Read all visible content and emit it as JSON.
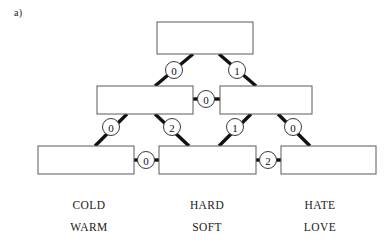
{
  "panel": {
    "label": "a)"
  },
  "diagram": {
    "type": "hierarchical-tree",
    "colors": {
      "background": "#ffffff",
      "box_fill": "#ffffff",
      "box_stroke": "#5a5a5a",
      "edge": "#111111",
      "circle_fill": "#ffffff",
      "circle_stroke": "#3a3a3a",
      "text": "#1a1a1a"
    },
    "nodes": [
      {
        "id": "root",
        "row": 1,
        "x": 157,
        "y": 22,
        "w": 96,
        "h": 32,
        "text": ""
      },
      {
        "id": "mid-left",
        "row": 2,
        "x": 97,
        "y": 86,
        "w": 96,
        "h": 28,
        "text": ""
      },
      {
        "id": "mid-right",
        "row": 2,
        "x": 220,
        "y": 86,
        "w": 92,
        "h": 28,
        "text": ""
      },
      {
        "id": "leaf-left",
        "row": 3,
        "x": 38,
        "y": 146,
        "w": 96,
        "h": 28,
        "text": ""
      },
      {
        "id": "leaf-center",
        "row": 3,
        "x": 159,
        "y": 146,
        "w": 97,
        "h": 28,
        "text": ""
      },
      {
        "id": "leaf-right",
        "row": 3,
        "x": 281,
        "y": 146,
        "w": 95,
        "h": 28,
        "text": ""
      }
    ],
    "edges": [
      {
        "id": "root-to-mid-left",
        "label": "0",
        "cx": 174,
        "cy": 70,
        "x1": 193,
        "y1": 54,
        "x2": 155,
        "y2": 86
      },
      {
        "id": "root-to-mid-right",
        "label": "1",
        "cx": 237,
        "cy": 70,
        "x1": 219,
        "y1": 54,
        "x2": 256,
        "y2": 86
      },
      {
        "id": "mid-left-to-mid-right",
        "label": "0",
        "cx": 206,
        "cy": 99,
        "x1": 193,
        "y1": 99,
        "x2": 220,
        "y2": 99
      },
      {
        "id": "mid-left-to-leaf-left",
        "label": "0",
        "cx": 111,
        "cy": 127,
        "x1": 127,
        "y1": 114,
        "x2": 95,
        "y2": 146
      },
      {
        "id": "mid-left-to-leaf-center",
        "label": "2",
        "cx": 172,
        "cy": 127,
        "x1": 155,
        "y1": 114,
        "x2": 189,
        "y2": 146
      },
      {
        "id": "mid-right-to-leaf-center",
        "label": "1",
        "cx": 235,
        "cy": 127,
        "x1": 251,
        "y1": 114,
        "x2": 219,
        "y2": 146
      },
      {
        "id": "mid-right-to-leaf-right",
        "label": "0",
        "cx": 293,
        "cy": 127,
        "x1": 278,
        "y1": 114,
        "x2": 310,
        "y2": 146
      },
      {
        "id": "leaf-left-to-leaf-center",
        "label": "0",
        "cx": 146,
        "cy": 160,
        "x1": 134,
        "y1": 160,
        "x2": 159,
        "y2": 160
      },
      {
        "id": "leaf-center-to-leaf-right",
        "label": "2",
        "cx": 268,
        "cy": 160,
        "x1": 256,
        "y1": 160,
        "x2": 281,
        "y2": 160
      }
    ],
    "leaf_labels": [
      {
        "id": "label-group-left",
        "x": 89,
        "lines": [
          "COLD",
          "WARM"
        ]
      },
      {
        "id": "label-group-center",
        "x": 207,
        "lines": [
          "HARD",
          "SOFT"
        ]
      },
      {
        "id": "label-group-right",
        "x": 320,
        "lines": [
          "HATE",
          "LOVE"
        ]
      }
    ],
    "label_rows_y": [
      209,
      231
    ]
  }
}
